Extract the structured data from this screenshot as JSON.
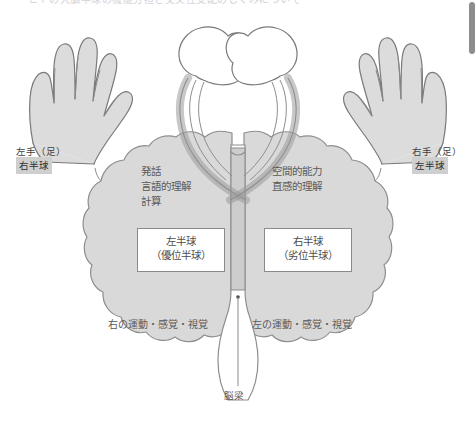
{
  "page": {
    "top_clipped_text": "ヒトの大脳半球の機能分担と交叉性支配のしくみについて",
    "background_color": "#ffffff"
  },
  "scrollbar": {
    "name": "vertical-scrollbar",
    "thumb_color": "#8d8d8d"
  },
  "diagram": {
    "title_hidden": "",
    "colors": {
      "brain_fill": "#d9d9d9",
      "brain_stroke": "#8e8e8e",
      "hand_fill": "#dcdcdc",
      "hand_stroke": "#7a7a7a",
      "tract_fill": "#c6c6c6",
      "tract_stroke": "#8e8e8e",
      "brainstem_fill": "#cdcdcd",
      "chip_bg": "#cfcfcf",
      "text": "#5a5a5a"
    },
    "left_side": {
      "limb_label": "左手（足）",
      "hemisphere_chip": "右半球"
    },
    "right_side": {
      "limb_label": "右手（足）",
      "hemisphere_chip": "左半球"
    },
    "left_hemisphere": {
      "functions": [
        "発話",
        "言語的理解",
        "計算"
      ],
      "box_title": "左半球",
      "box_subtitle": "（優位半球）",
      "sensory_line": "右の運動・感覚・視覚"
    },
    "right_hemisphere": {
      "functions": [
        "空間的能力",
        "直感的理解"
      ],
      "box_title": "右半球",
      "box_subtitle": "（劣位半球）",
      "sensory_line": "左の運動・感覚・視覚"
    },
    "callosum": {
      "label": "脳梁"
    }
  }
}
